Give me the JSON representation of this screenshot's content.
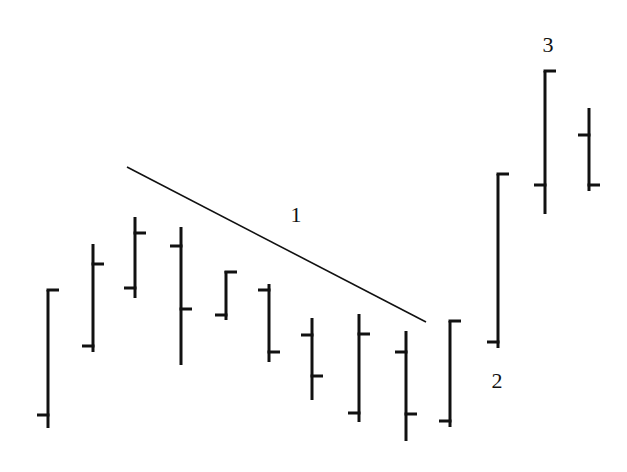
{
  "chart_data": {
    "type": "ohlc",
    "title": "",
    "xlabel": "",
    "ylabel": "",
    "grid": false,
    "legend": null,
    "note": "Price bars (open tick left, close tick right) in pixel coordinates; lower y = higher price.",
    "bars": [
      {
        "x": 48,
        "high": 290,
        "low": 428,
        "open": 415,
        "close": 290
      },
      {
        "x": 93,
        "high": 244,
        "low": 352,
        "open": 346,
        "close": 264
      },
      {
        "x": 135,
        "high": 217,
        "low": 298,
        "open": 288,
        "close": 233
      },
      {
        "x": 181,
        "high": 227,
        "low": 365,
        "open": 246,
        "close": 309
      },
      {
        "x": 226,
        "high": 271,
        "low": 320,
        "open": 315,
        "close": 272
      },
      {
        "x": 269,
        "high": 284,
        "low": 362,
        "open": 290,
        "close": 352
      },
      {
        "x": 312,
        "high": 318,
        "low": 400,
        "open": 335,
        "close": 376
      },
      {
        "x": 359,
        "high": 314,
        "low": 422,
        "open": 413,
        "close": 334
      },
      {
        "x": 406,
        "high": 331,
        "low": 441,
        "open": 352,
        "close": 414
      },
      {
        "x": 450,
        "high": 321,
        "low": 427,
        "open": 421,
        "close": 321
      },
      {
        "x": 498,
        "high": 174,
        "low": 348,
        "open": 342,
        "close": 174
      },
      {
        "x": 545,
        "high": 71,
        "low": 214,
        "open": 185,
        "close": 71
      },
      {
        "x": 589,
        "high": 108,
        "low": 191,
        "open": 135,
        "close": 185
      }
    ],
    "trendline": {
      "x1": 127,
      "y1": 167,
      "x2": 426,
      "y2": 322
    },
    "annotations": [
      {
        "text": "1",
        "x": 296,
        "y": 222
      },
      {
        "text": "2",
        "x": 497,
        "y": 388
      },
      {
        "text": "3",
        "x": 548,
        "y": 52
      }
    ]
  },
  "colors": {
    "bar": "#111111",
    "trendline": "#111111",
    "background": "#ffffff"
  }
}
